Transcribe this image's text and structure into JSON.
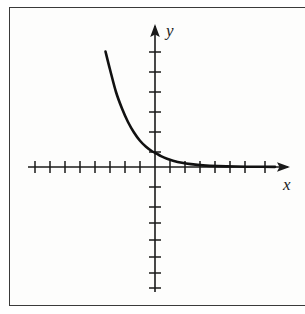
{
  "figure": {
    "type": "math-graph",
    "background_color": "#ffffff",
    "frame_color": "#3a3a3a",
    "ink_color": "#1a1a1a"
  },
  "axes": {
    "x_label": "x",
    "y_label": "y",
    "origin_px": {
      "x": 155,
      "y": 167
    },
    "tick_spacing_px": 15,
    "x_axis": {
      "line_start_px": 28,
      "line_end_px": 290,
      "arrow_end": "right",
      "ticks_left_of_origin": 8,
      "ticks_right_of_origin": 7
    },
    "y_axis": {
      "line_start_px": 24,
      "line_end_px": 292,
      "arrow_end": "top",
      "ticks_above_origin": 6,
      "ticks_below_origin": 7
    }
  },
  "chart_data": {
    "type": "line",
    "title": "",
    "xlabel": "x",
    "ylabel": "y",
    "legend": [],
    "grid": false,
    "xlim": [
      -8.5,
      8.5
    ],
    "ylim": [
      -7.5,
      7.5
    ],
    "xticks": [
      -8,
      -7,
      -6,
      -5,
      -4,
      -3,
      -2,
      -1,
      1,
      2,
      3,
      4,
      5,
      6,
      7
    ],
    "yticks": [
      -7,
      -6,
      -5,
      -4,
      -3,
      -2,
      -1,
      1,
      2,
      3,
      4,
      5,
      6
    ],
    "series": [
      {
        "name": "exponential decay",
        "x": [
          -3.3,
          -3.0,
          -2.6,
          -2.2,
          -1.8,
          -1.4,
          -1.0,
          -0.6,
          -0.2,
          0.0,
          0.4,
          0.8,
          1.2,
          1.8,
          2.4,
          3.2,
          4.2,
          5.4,
          6.8,
          8.0
        ],
        "y": [
          7.7,
          6.5,
          5.0,
          3.9,
          3.0,
          2.3,
          1.75,
          1.35,
          1.05,
          0.95,
          0.72,
          0.55,
          0.42,
          0.28,
          0.19,
          0.11,
          0.06,
          0.03,
          0.015,
          0.01
        ]
      }
    ]
  }
}
